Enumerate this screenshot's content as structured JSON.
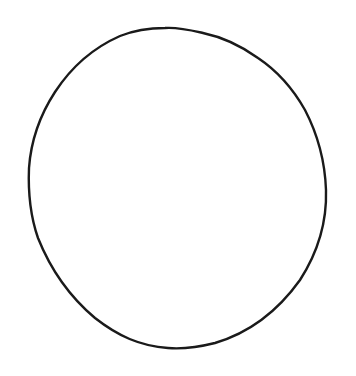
{
  "image": {
    "subject": "hand-drawn circle outline",
    "background_color": "#ffffff",
    "stroke_color": "#1a1a1a"
  }
}
